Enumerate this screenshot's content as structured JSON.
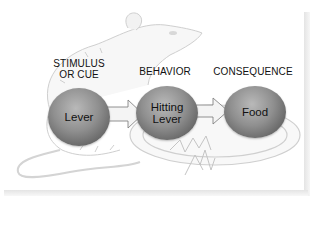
{
  "diagram": {
    "title": "",
    "stages": [
      {
        "heading": "STIMULUS\nOR CUE",
        "heading_lines": [
          "STIMULUS",
          "OR CUE"
        ],
        "node_lines": [
          "Lever"
        ]
      },
      {
        "heading": "BEHAVIOR",
        "heading_lines": [
          "BEHAVIOR"
        ],
        "node_lines": [
          "Hitting",
          "Lever"
        ]
      },
      {
        "heading": "CONSEQUENCE",
        "heading_lines": [
          "CONSEQUENCE"
        ],
        "node_lines": [
          "Food"
        ]
      }
    ],
    "arrows": [
      {
        "from": "Lever",
        "to": "Hitting Lever"
      },
      {
        "from": "Hitting Lever",
        "to": "Food"
      }
    ],
    "background_illustration": "rat-sketch-with-food-plate",
    "colors": {
      "node_fill": "#8f8f8f",
      "node_shadow": "#4a4a4a",
      "sketch_line": "#c8c8c8",
      "text": "#111111"
    }
  }
}
